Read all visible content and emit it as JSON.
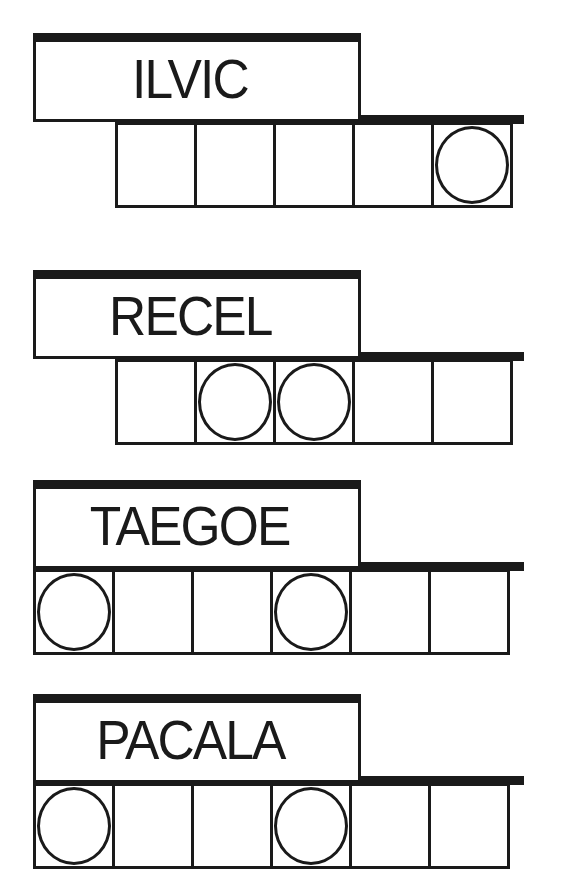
{
  "puzzle": {
    "type": "scrambled-word-jumble",
    "colors": {
      "ink": "#1a1a1a",
      "paper": "#ffffff"
    },
    "words": [
      {
        "scrambled": "ILVIC",
        "letters": 5,
        "row_offset_cells": 1,
        "circled_positions": [
          5
        ]
      },
      {
        "scrambled": "RECEL",
        "letters": 5,
        "row_offset_cells": 1,
        "circled_positions": [
          2,
          3
        ]
      },
      {
        "scrambled": "TAEGOE",
        "letters": 6,
        "row_offset_cells": 0,
        "circled_positions": [
          1,
          4
        ]
      },
      {
        "scrambled": "PACALA",
        "letters": 6,
        "row_offset_cells": 0,
        "circled_positions": [
          1,
          4
        ]
      }
    ]
  }
}
